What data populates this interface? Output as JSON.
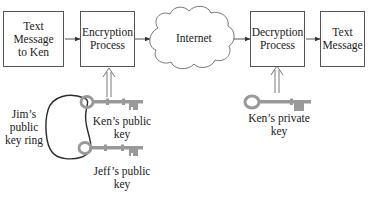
{
  "diagram": {
    "type": "public-key-encryption-flow",
    "nodes": {
      "plaintext_in": {
        "label": "Text Message to Ken",
        "lines": [
          "Text",
          "Message",
          "to Ken"
        ]
      },
      "encryption": {
        "label": "Encryption Process",
        "lines": [
          "Encryption",
          "Process"
        ]
      },
      "internet": {
        "label": "Internet"
      },
      "decryption": {
        "label": "Decryption Process",
        "lines": [
          "Decryption",
          "Process"
        ]
      },
      "plaintext_out": {
        "label": "Text Message",
        "lines": [
          "Text",
          "Message"
        ]
      }
    },
    "keys": {
      "keyring": {
        "lines": [
          "Jim’s",
          "public",
          "key ring"
        ]
      },
      "ken_public": {
        "lines": [
          "Ken’s public",
          "key"
        ]
      },
      "jeff_public": {
        "lines": [
          "Jeff’s public",
          "key"
        ]
      },
      "ken_private": {
        "lines": [
          "Ken’s private",
          "key"
        ]
      }
    },
    "edges": [
      {
        "from": "plaintext_in",
        "to": "encryption"
      },
      {
        "from": "encryption",
        "to": "internet"
      },
      {
        "from": "internet",
        "to": "decryption"
      },
      {
        "from": "decryption",
        "to": "plaintext_out"
      },
      {
        "from": "ken_public",
        "to": "encryption",
        "style": "double-arrow"
      },
      {
        "from": "ken_private",
        "to": "decryption",
        "style": "double-arrow"
      }
    ],
    "colors": {
      "stroke": "#555555",
      "key_fill": "#9a9a9a",
      "ring": "#2a2a2a"
    }
  }
}
